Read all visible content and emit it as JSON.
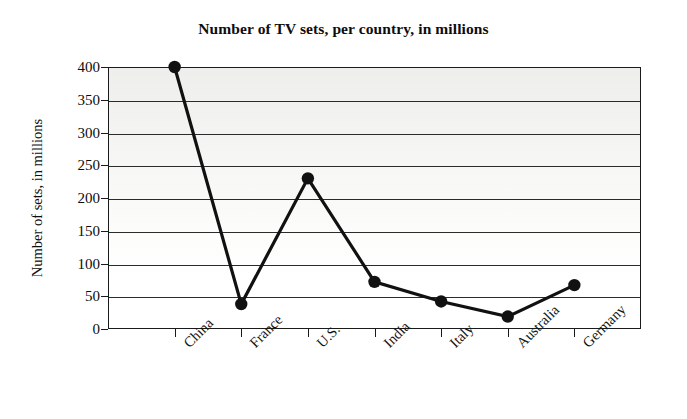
{
  "chart_data": {
    "type": "line",
    "title": "Number of TV sets, per country, in millions",
    "xlabel": "",
    "ylabel": "Number of sets, in millions",
    "categories": [
      "China",
      "France",
      "U.S.",
      "India",
      "Italy",
      "Australia",
      "Germany"
    ],
    "values": [
      400,
      38,
      230,
      72,
      42,
      19,
      67
    ],
    "ylim": [
      0,
      400
    ],
    "ytick_labels": [
      "400",
      "350",
      "300",
      "250",
      "200",
      "150",
      "100",
      "50",
      "0"
    ],
    "ytick_values": [
      400,
      350,
      300,
      250,
      200,
      150,
      100,
      50,
      0
    ],
    "ytick_step": 50,
    "grid": "horizontal",
    "legend": "none",
    "marker": "filled-circle",
    "line_color": "#111111",
    "marker_color": "#111111",
    "plot_background": "#f2f2f0",
    "frame_color": "#1a1a1a"
  },
  "figure": {
    "background": "#ffffff"
  }
}
